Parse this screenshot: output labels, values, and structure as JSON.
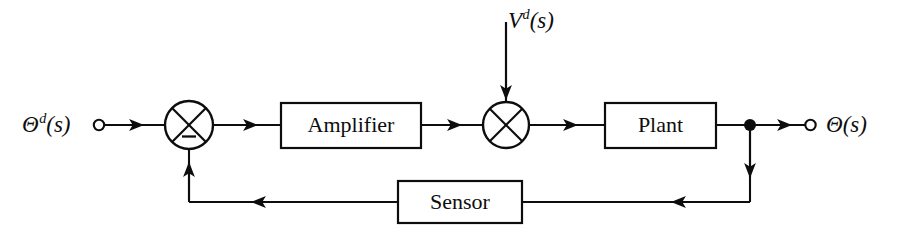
{
  "diagram": {
    "type": "control-block-diagram",
    "background_color": "#ffffff",
    "stroke_color": "#0d0d0d",
    "signals": {
      "input": {
        "base": "Θ",
        "superscript": "d",
        "argument": "(s)",
        "full": "Θᵈ(s)",
        "terminal": "open-circle"
      },
      "disturbance": {
        "base": "V",
        "superscript": "d",
        "argument": "(s)",
        "full": "Vᵈ(s)",
        "terminal": "none"
      },
      "output": {
        "base": "Θ",
        "superscript": "",
        "argument": "(s)",
        "full": "Θ(s)",
        "terminal": "open-circle"
      }
    },
    "blocks": [
      {
        "id": "amplifier",
        "label": "Amplifier"
      },
      {
        "id": "plant",
        "label": "Plant"
      },
      {
        "id": "sensor",
        "label": "Sensor"
      }
    ],
    "summing_junctions": [
      {
        "id": "error-junction",
        "style": "circle-with-x",
        "signs": {
          "feedback_input": "−"
        },
        "inputs": [
          "input-signal",
          "sensor-feedback"
        ],
        "output": "amplifier"
      },
      {
        "id": "disturbance-junction",
        "style": "circle-with-x",
        "signs": {},
        "inputs": [
          "amplifier-output",
          "disturbance-signal"
        ],
        "output": "plant"
      }
    ],
    "nodes": [
      {
        "id": "output-tap",
        "style": "filled-dot"
      }
    ]
  }
}
